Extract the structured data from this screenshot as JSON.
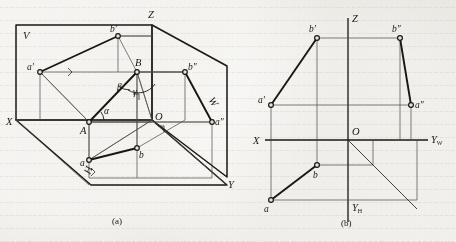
{
  "figure": {
    "type": "descriptive-geometry-projection",
    "captions": {
      "left": "(a)",
      "right": "(b)"
    }
  },
  "pictorial": {
    "planes": {
      "v": "V",
      "w": "W",
      "h": "H"
    },
    "axes": {
      "x": "X",
      "y": "Y",
      "z": "Z",
      "origin": "O"
    },
    "points": {
      "A": "A",
      "B": "B",
      "a_front": "a'",
      "b_front": "b'",
      "a_side": "a″",
      "b_side": "b″",
      "a_top": "a",
      "b_top": "b"
    },
    "angles": {
      "alpha": "α",
      "beta": "β",
      "gamma": "γ"
    }
  },
  "orthographic": {
    "axes": {
      "x": "X",
      "z": "Z",
      "y_w": "Y",
      "y_w_sub": "W",
      "y_h": "Y",
      "y_h_sub": "H",
      "origin": "O"
    },
    "points": {
      "a_front": "a'",
      "b_front": "b'",
      "a_side": "a″",
      "b_side": "b″",
      "a_top": "a",
      "b_top": "b"
    }
  },
  "colors": {
    "ink": "#16140f",
    "thin_ink": "#3c3a34",
    "paper": "#e8e6e0"
  }
}
